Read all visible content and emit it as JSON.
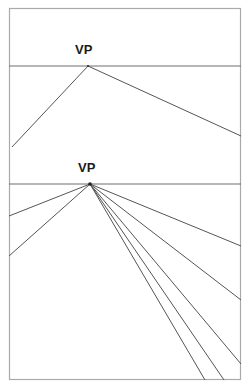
{
  "figure": {
    "title": "",
    "canvas": {
      "width": 251,
      "height": 392,
      "background": "#ffffff"
    },
    "frame": {
      "name": "outer-border",
      "x": 9,
      "y": 8,
      "width": 232,
      "height": 372,
      "stroke": "#aaaaaa",
      "stroke_width": 1.2
    },
    "line_color": "#555555",
    "horizon_color": "#6e6e6e",
    "labels": [
      {
        "id": "upper",
        "text": "VP",
        "x": 75,
        "y": 43
      },
      {
        "id": "lower",
        "text": "VP",
        "x": 78,
        "y": 161
      }
    ],
    "panels": [
      {
        "id": "upper-panel",
        "name": "one-point-perspective-upper",
        "horizon_line": {
          "y": 66,
          "x1": 9,
          "x2": 241
        },
        "vanishing_point": {
          "x": 88,
          "y": 66
        },
        "rays": [
          {
            "id": "upper-ray-left",
            "x2": 12,
            "y2": 147
          },
          {
            "id": "upper-ray-right",
            "x2": 241,
            "y2": 136
          }
        ]
      },
      {
        "id": "lower-panel",
        "name": "one-point-perspective-lower",
        "horizon_line": {
          "y": 184,
          "x1": 9,
          "x2": 241
        },
        "vanishing_point": {
          "x": 90,
          "y": 184
        },
        "rays": [
          {
            "id": "lower-ray-l1",
            "x2": 9,
            "y2": 216
          },
          {
            "id": "lower-ray-l2",
            "x2": 9,
            "y2": 256
          },
          {
            "id": "lower-ray-r1",
            "x2": 241,
            "y2": 246
          },
          {
            "id": "lower-ray-r2",
            "x2": 241,
            "y2": 300
          },
          {
            "id": "lower-ray-r3",
            "x2": 241,
            "y2": 364
          },
          {
            "id": "lower-ray-r4",
            "x2": 224,
            "y2": 380
          },
          {
            "id": "lower-ray-r5",
            "x2": 205,
            "y2": 380
          }
        ]
      }
    ],
    "divider_line": {
      "id": "mid-divider",
      "y": 184,
      "x1": 9,
      "x2": 241
    }
  }
}
